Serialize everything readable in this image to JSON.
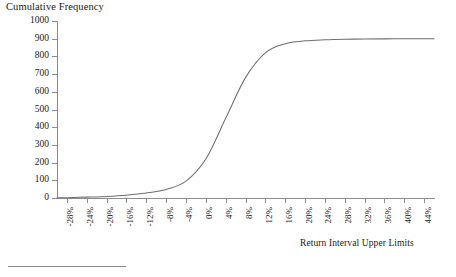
{
  "chart_data": {
    "type": "line",
    "title": "Cumulative Frequency",
    "xlabel": "Return Interval Upper Limits",
    "ylabel": "",
    "grid": false,
    "legend": "none",
    "ylim": [
      0,
      1000
    ],
    "y_ticks": [
      0,
      100,
      200,
      300,
      400,
      500,
      600,
      700,
      800,
      900,
      1000
    ],
    "categories": [
      "-28%",
      "-24%",
      "-20%",
      "-16%",
      "-12%",
      "-8%",
      "-4%",
      "0%",
      "4%",
      "8%",
      "12%",
      "16%",
      "20%",
      "24%",
      "28%",
      "32%",
      "36%",
      "40%",
      "44%"
    ],
    "x_tick_rotation": -90,
    "series": [
      {
        "name": "Cumulative Frequency",
        "values": [
          2,
          5,
          9,
          16,
          28,
          48,
          95,
          220,
          450,
          680,
          820,
          872,
          888,
          894,
          897,
          898,
          899,
          900,
          900
        ]
      }
    ],
    "curve_shape": "ogive",
    "plateau_value": 900,
    "inflection_category": "4%",
    "line_color": "#6e6e6e",
    "axis_color": "#8d8d8d"
  },
  "footnote": {
    "rule_visible": true
  }
}
